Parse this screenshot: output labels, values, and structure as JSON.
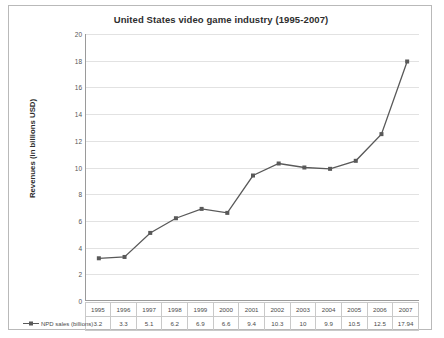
{
  "chart_data": {
    "type": "line",
    "title": "United States video game industry (1995-2007)",
    "xlabel": "",
    "ylabel": "Revenues (in billions USD)",
    "ylim": [
      0,
      20
    ],
    "ytick_step": 2,
    "yticks": [
      0,
      2,
      4,
      6,
      8,
      10,
      12,
      14,
      16,
      18,
      20
    ],
    "grid": true,
    "legend_position": "bottom-left",
    "categories": [
      "1995",
      "1996",
      "1997",
      "1998",
      "1999",
      "2000",
      "2001",
      "2002",
      "2003",
      "2004",
      "2005",
      "2006",
      "2007"
    ],
    "series": [
      {
        "name": "NPD sales (billions)",
        "values": [
          3.2,
          3.3,
          5.1,
          6.2,
          6.9,
          6.6,
          9.4,
          10.3,
          10,
          9.9,
          10.5,
          12.5,
          17.94
        ],
        "color": "#595959",
        "marker": "square"
      }
    ],
    "value_labels": [
      "3.2",
      "3.3",
      "5.1",
      "6.2",
      "6.9",
      "6.6",
      "9.4",
      "10.3",
      "10",
      "9.9",
      "10.5",
      "12.5",
      "17.94"
    ]
  },
  "table": {
    "row_label": "NPD sales (billions)"
  },
  "colors": {
    "line": "#595959",
    "grid": "#e2e2e2",
    "axis": "#9a9a9a",
    "border": "#b9b9b9"
  }
}
